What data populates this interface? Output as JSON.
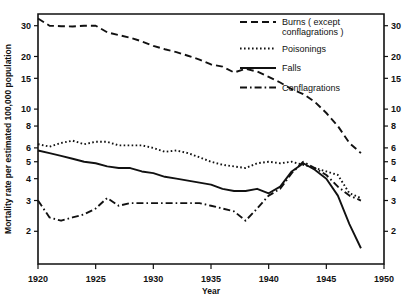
{
  "chart_data": {
    "type": "line",
    "title": "",
    "xlabel": "Year",
    "ylabel": "Mortality rate per estimated 100,000 population",
    "xlim": [
      1920,
      1950
    ],
    "ylim": [
      1.3,
      35
    ],
    "yscale": "log",
    "grid": false,
    "legend_position": "top-right",
    "xticks": [
      1920,
      1925,
      1930,
      1935,
      1940,
      1945,
      1950
    ],
    "xtick_labels": [
      "1920",
      "1925",
      "1930",
      "1935",
      "1940",
      "1945",
      "1950"
    ],
    "yticks": [
      30,
      20,
      15,
      10,
      8,
      6,
      5,
      4,
      3,
      2
    ],
    "ytick_labels": [
      "30",
      "20",
      "15",
      "10",
      "8",
      "6",
      "5",
      "4",
      "3",
      "2"
    ],
    "right_axis_labels": [
      "30",
      "20",
      "15",
      "10",
      "8",
      "6",
      "5",
      "4",
      "3",
      "2"
    ],
    "x": [
      1920,
      1921,
      1922,
      1923,
      1924,
      1925,
      1926,
      1927,
      1928,
      1929,
      1930,
      1931,
      1932,
      1933,
      1934,
      1935,
      1936,
      1937,
      1938,
      1939,
      1940,
      1941,
      1942,
      1943,
      1944,
      1945,
      1946,
      1947,
      1948
    ],
    "series": [
      {
        "name": "Burns (except conflagrations)",
        "style": "dashed",
        "values": [
          33.0,
          30.0,
          29.8,
          29.7,
          30.0,
          30.0,
          27.5,
          26.5,
          25.6,
          24.4,
          23.0,
          22.0,
          21.2,
          20.2,
          19.2,
          18.0,
          17.5,
          16.2,
          17.0,
          16.4,
          15.3,
          14.2,
          13.0,
          12.2,
          11.0,
          9.5,
          8.0,
          6.4,
          5.6
        ]
      },
      {
        "name": "Poisonings",
        "style": "dotted",
        "values": [
          6.3,
          6.1,
          6.4,
          6.6,
          6.3,
          6.5,
          6.5,
          6.2,
          6.2,
          6.2,
          6.0,
          5.7,
          5.8,
          5.6,
          5.3,
          5.0,
          4.8,
          4.7,
          4.6,
          4.9,
          5.0,
          4.9,
          5.0,
          4.8,
          4.6,
          4.4,
          4.2,
          3.3,
          3.1
        ]
      },
      {
        "name": "Falls",
        "style": "solid",
        "values": [
          5.8,
          5.6,
          5.4,
          5.2,
          5.0,
          4.9,
          4.7,
          4.6,
          4.6,
          4.4,
          4.3,
          4.1,
          4.0,
          3.9,
          3.8,
          3.7,
          3.5,
          3.4,
          3.4,
          3.5,
          3.3,
          3.6,
          4.4,
          4.9,
          4.5,
          4.0,
          3.2,
          2.2,
          1.6
        ]
      },
      {
        "name": "Conflagrations",
        "style": "dashdot",
        "values": [
          3.0,
          2.4,
          2.3,
          2.4,
          2.5,
          2.7,
          3.1,
          2.8,
          2.9,
          2.9,
          2.9,
          2.9,
          2.9,
          2.9,
          2.9,
          2.8,
          2.7,
          2.6,
          2.3,
          2.7,
          3.2,
          3.5,
          4.3,
          5.0,
          4.6,
          4.2,
          3.6,
          3.2,
          3.0
        ]
      }
    ]
  },
  "legend": {
    "items": [
      {
        "label_line1": "Burns ( except",
        "label_line2": "conflagrations )",
        "style": "dashed"
      },
      {
        "label_line1": "Poisonings",
        "label_line2": "",
        "style": "dotted"
      },
      {
        "label_line1": "Falls",
        "label_line2": "",
        "style": "solid"
      },
      {
        "label_line1": "Conflagrations",
        "label_line2": "",
        "style": "dashdot"
      }
    ]
  }
}
